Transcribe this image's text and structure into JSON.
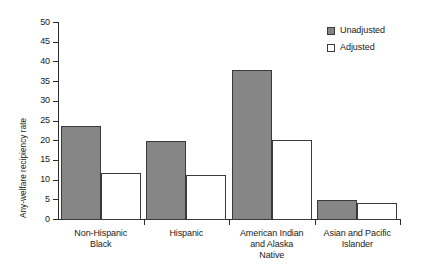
{
  "chart_data": {
    "type": "bar",
    "title": "",
    "xlabel": "",
    "ylabel": "Any-welfare recipiency rate",
    "ylim": [
      0,
      50
    ],
    "y_ticks": [
      0,
      5,
      10,
      15,
      20,
      25,
      30,
      35,
      40,
      45,
      50
    ],
    "grid": false,
    "legend_position": "top-right",
    "categories": [
      "Non-Hispanic\nBlack",
      "Hispanic",
      "American Indian\nand Alaska\nNative",
      "Asian and Pacific\nIslander"
    ],
    "category_lines": [
      [
        "Non-Hispanic",
        "Black"
      ],
      [
        "Hispanic"
      ],
      [
        "American Indian",
        "and Alaska",
        "Native"
      ],
      [
        "Asian and Pacific",
        "Islander"
      ]
    ],
    "series": [
      {
        "name": "Unadjusted",
        "color": "#868686",
        "values": [
          23.7,
          19.7,
          37.7,
          4.8
        ]
      },
      {
        "name": "Adjusted",
        "color": "#ffffff",
        "values": [
          11.7,
          11.2,
          20.1,
          4.0
        ]
      }
    ]
  },
  "legend": {
    "items": [
      {
        "label": "Unadjusted",
        "swatch": "filled-gray-square"
      },
      {
        "label": "Adjusted",
        "swatch": "open-white-square"
      }
    ]
  },
  "axes": {
    "y_title": "Any-welfare recipiency rate",
    "y_tick_labels": [
      "0",
      "5",
      "10",
      "15",
      "20",
      "25",
      "30",
      "35",
      "40",
      "45",
      "50"
    ]
  },
  "colors": {
    "unadjusted_fill": "#868686",
    "adjusted_fill": "#ffffff",
    "bar_stroke": "#3a3a3a",
    "axis": "#2b2b2b",
    "text": "#1a1a1a",
    "background": "#ffffff"
  }
}
